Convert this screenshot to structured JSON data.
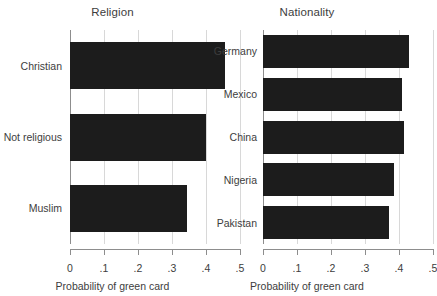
{
  "chart_data": [
    {
      "type": "bar",
      "orientation": "horizontal",
      "title": "Religion",
      "xlabel": "Probability of green card",
      "ylabel": "",
      "categories": [
        "Christian",
        "Not religious",
        "Muslim"
      ],
      "values": [
        0.455,
        0.4,
        0.345
      ],
      "xlim": [
        0,
        0.5
      ],
      "xticks": [
        0,
        0.1,
        0.2,
        0.3,
        0.4,
        0.5
      ],
      "xticklabels": [
        "0",
        ".1",
        ".2",
        ".3",
        ".4",
        ".5"
      ],
      "grid": "vertical",
      "legend": "none",
      "bar_color": "#1c1c1c"
    },
    {
      "type": "bar",
      "orientation": "horizontal",
      "title": "Nationality",
      "xlabel": "Probability of green card",
      "ylabel": "",
      "categories": [
        "Germany",
        "Mexico",
        "China",
        "Nigeria",
        "Pakistan"
      ],
      "values": [
        0.43,
        0.408,
        0.415,
        0.385,
        0.37
      ],
      "xlim": [
        0,
        0.5
      ],
      "xticks": [
        0,
        0.1,
        0.2,
        0.3,
        0.4,
        0.5
      ],
      "xticklabels": [
        "0",
        ".1",
        ".2",
        ".3",
        ".4",
        ".5"
      ],
      "grid": "vertical",
      "legend": "none",
      "bar_color": "#1c1c1c"
    }
  ],
  "panels": {
    "religion": {
      "title": "Religion",
      "xaxis_title": "Probability of green card",
      "ticklabels": [
        "0",
        ".1",
        ".2",
        ".3",
        ".4",
        ".5"
      ],
      "bars": [
        {
          "label": "Christian",
          "value": 0.455
        },
        {
          "label": "Not religious",
          "value": 0.4
        },
        {
          "label": "Muslim",
          "value": 0.345
        }
      ]
    },
    "nationality": {
      "title": "Nationality",
      "xaxis_title": "Probability of green card",
      "ticklabels": [
        "0",
        ".1",
        ".2",
        ".3",
        ".4",
        ".5"
      ],
      "bars": [
        {
          "label": "Germany",
          "value": 0.43
        },
        {
          "label": "Mexico",
          "value": 0.408
        },
        {
          "label": "China",
          "value": 0.415
        },
        {
          "label": "Nigeria",
          "value": 0.385
        },
        {
          "label": "Pakistan",
          "value": 0.37
        }
      ]
    }
  }
}
